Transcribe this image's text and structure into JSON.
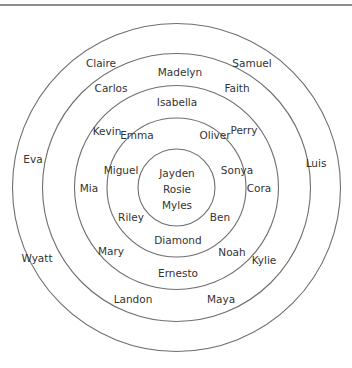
{
  "diagram": {
    "type": "concentric-circles",
    "center": {
      "x": 176.5,
      "y": 187.5
    },
    "ring_color": "#6e6e6e",
    "text_color": "#333333",
    "rings": [
      {
        "id": "ring-1",
        "radius": 164
      },
      {
        "id": "ring-2",
        "radius": 134
      },
      {
        "id": "ring-3",
        "radius": 102
      },
      {
        "id": "ring-4",
        "radius": 69.5
      },
      {
        "id": "ring-5",
        "radius": 38.5
      }
    ],
    "labels": [
      {
        "text": "Claire",
        "x": 101,
        "y": 64,
        "ring": "outer"
      },
      {
        "text": "Madelyn",
        "x": 180,
        "y": 73,
        "ring": "band-2"
      },
      {
        "text": "Samuel",
        "x": 252,
        "y": 64,
        "ring": "outer"
      },
      {
        "text": "Carlos",
        "x": 111,
        "y": 89,
        "ring": "band-2"
      },
      {
        "text": "Faith",
        "x": 237,
        "y": 89,
        "ring": "band-2"
      },
      {
        "text": "Isabella",
        "x": 177,
        "y": 103,
        "ring": "band-3"
      },
      {
        "text": "Kevin",
        "x": 107,
        "y": 132,
        "ring": "band-3"
      },
      {
        "text": "Emma",
        "x": 137,
        "y": 136,
        "ring": "band-4"
      },
      {
        "text": "Oliver",
        "x": 215,
        "y": 136,
        "ring": "band-4"
      },
      {
        "text": "Perry",
        "x": 244,
        "y": 131,
        "ring": "band-3"
      },
      {
        "text": "Eva",
        "x": 33,
        "y": 160,
        "ring": "outer"
      },
      {
        "text": "Luis",
        "x": 316,
        "y": 164,
        "ring": "outer"
      },
      {
        "text": "Miguel",
        "x": 121,
        "y": 171,
        "ring": "band-4"
      },
      {
        "text": "Sonya",
        "x": 237,
        "y": 171,
        "ring": "band-4"
      },
      {
        "text": "Jayden",
        "x": 177,
        "y": 174,
        "ring": "center"
      },
      {
        "text": "Mia",
        "x": 89,
        "y": 189,
        "ring": "band-3"
      },
      {
        "text": "Cora",
        "x": 259,
        "y": 189,
        "ring": "band-3"
      },
      {
        "text": "Rosie",
        "x": 177,
        "y": 190,
        "ring": "center"
      },
      {
        "text": "Myles",
        "x": 177,
        "y": 206,
        "ring": "center"
      },
      {
        "text": "Riley",
        "x": 131,
        "y": 218,
        "ring": "band-4"
      },
      {
        "text": "Ben",
        "x": 220,
        "y": 218,
        "ring": "band-4"
      },
      {
        "text": "Diamond",
        "x": 178,
        "y": 241,
        "ring": "band-4"
      },
      {
        "text": "Mary",
        "x": 111,
        "y": 252,
        "ring": "band-3"
      },
      {
        "text": "Noah",
        "x": 232,
        "y": 253,
        "ring": "band-3"
      },
      {
        "text": "Wyatt",
        "x": 37,
        "y": 259,
        "ring": "outer"
      },
      {
        "text": "Kylie",
        "x": 264,
        "y": 261,
        "ring": "band-2"
      },
      {
        "text": "Ernesto",
        "x": 178,
        "y": 274,
        "ring": "band-3"
      },
      {
        "text": "Landon",
        "x": 133,
        "y": 300,
        "ring": "band-2"
      },
      {
        "text": "Maya",
        "x": 221,
        "y": 300,
        "ring": "band-2"
      }
    ]
  }
}
